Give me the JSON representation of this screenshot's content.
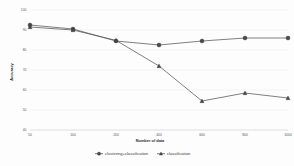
{
  "chart_data": {
    "type": "line",
    "title": "",
    "xlabel": "Number of data",
    "ylabel": "Accuracy",
    "categories": [
      "50",
      "100",
      "200",
      "400",
      "600",
      "800",
      "1000"
    ],
    "xlim": [
      0,
      6
    ],
    "ylim": [
      40,
      100
    ],
    "yticks": [
      40,
      50,
      60,
      70,
      80,
      90,
      100
    ],
    "ytick_labels": [
      "40",
      "50",
      "60",
      "70",
      "80",
      "90",
      "100"
    ],
    "grid": true,
    "legend_position": "bottom",
    "series": [
      {
        "name": "clustering+classification",
        "marker": "circle",
        "color": "#4a4a4a",
        "values": [
          92.5,
          90.5,
          84.5,
          82.5,
          84.5,
          86.0,
          86.0
        ]
      },
      {
        "name": "classification",
        "marker": "triangle",
        "color": "#4a4a4a",
        "values": [
          91.5,
          90.0,
          84.8,
          72.0,
          54.5,
          58.5,
          56.0
        ]
      }
    ]
  },
  "legend": {
    "items": [
      {
        "label": "clustering+classification",
        "marker": "circle"
      },
      {
        "label": "classification",
        "marker": "triangle"
      }
    ]
  },
  "axes": {
    "x_title": "Number of data",
    "y_title": "Accuracy"
  }
}
